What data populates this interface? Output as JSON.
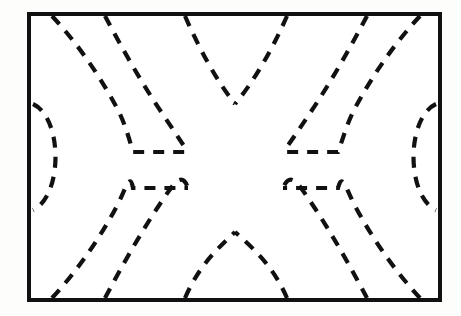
{
  "figure": {
    "type": "contour-plot",
    "title": "",
    "background_color": "#fdfdfc",
    "plot_area_color": "#ffffff",
    "line_color": "#111111",
    "frame": {
      "x": 29,
      "y": 14,
      "width": 411,
      "height": 286,
      "stroke_width": 4,
      "style": "solid"
    },
    "contour_style": {
      "stroke_width": 4.2,
      "dash_pattern": "11 9",
      "style": "dashed"
    }
  },
  "chart_data": {
    "type": "line",
    "title": "",
    "xlabel": "",
    "ylabel": "",
    "grid": false,
    "legend": null,
    "xlim": [
      29,
      440
    ],
    "ylim": [
      14,
      300
    ],
    "symmetry": [
      "vertical-mirror-about-x-235",
      "horizontal-mirror-about-y-157"
    ],
    "annotations": [
      {
        "name": "upper-center-vertex",
        "x": 235,
        "y": 104,
        "shape": "V"
      },
      {
        "name": "lower-center-vertex",
        "x": 235,
        "y": 232,
        "shape": "inverted-V"
      },
      {
        "name": "upper-left-shelf",
        "x1": 133,
        "x2": 188,
        "y": 152
      },
      {
        "name": "upper-right-shelf",
        "x1": 283,
        "x2": 338,
        "y": 152
      },
      {
        "name": "lower-left-shelf",
        "x1": 133,
        "x2": 188,
        "y": 188
      },
      {
        "name": "lower-right-shelf",
        "x1": 283,
        "x2": 338,
        "y": 188
      }
    ],
    "series": [
      {
        "name": "left-edge-arc",
        "kind": "arc",
        "path": "M 33,104 C 63,118 63,196 33,210"
      },
      {
        "name": "right-edge-arc",
        "kind": "arc",
        "path": "M 436,104 C 406,118 406,196 436,210"
      },
      {
        "name": "upper-left-outer",
        "kind": "contour",
        "path": "M 52,16 C 78,44 100,76 118,110 C 126,126 130,142 133,152 L 188,152"
      },
      {
        "name": "upper-left-inner",
        "kind": "contour",
        "path": "M 105,16 C 122,48 142,84 164,116 C 174,131 182,143 188,152"
      },
      {
        "name": "upper-left-center",
        "kind": "contour",
        "path": "M 185,16 C 199,48 216,80 235,104"
      },
      {
        "name": "upper-right-center",
        "kind": "contour",
        "path": "M 287,16 C 273,48 255,80 235,104"
      },
      {
        "name": "upper-right-inner",
        "kind": "contour",
        "path": "M 367,16 C 350,48 330,84 308,116 C 298,131 290,143 283,152"
      },
      {
        "name": "upper-right-outer",
        "kind": "contour",
        "path": "M 420,16 C 394,44 372,76 354,110 C 346,126 342,142 338,152 L 283,152"
      },
      {
        "name": "lower-left-outer",
        "kind": "contour",
        "path": "M 52,298 C 78,270 100,238 118,204 C 126,188 130,172 133,188 L 188,188"
      },
      {
        "name": "lower-left-inner",
        "kind": "contour",
        "path": "M 105,298 C 122,266 142,230 164,198 C 174,183 182,171 188,188"
      },
      {
        "name": "lower-left-center",
        "kind": "contour",
        "path": "M 185,298 C 199,266 216,250 235,232"
      },
      {
        "name": "lower-right-center",
        "kind": "contour",
        "path": "M 287,298 C 273,266 255,250 235,232"
      },
      {
        "name": "lower-right-inner",
        "kind": "contour",
        "path": "M 367,298 C 350,266 330,230 308,198 C 298,183 290,171 283,188"
      },
      {
        "name": "lower-right-outer",
        "kind": "contour",
        "path": "M 420,298 C 394,270 372,238 354,204 C 346,188 342,172 338,188 L 283,188"
      }
    ]
  }
}
